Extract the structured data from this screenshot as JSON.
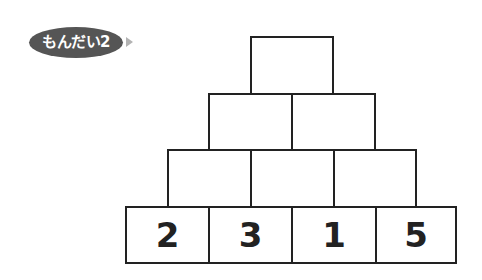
{
  "header": {
    "badge_label": "もんだい2",
    "arrow_icon": "triangle-right-icon"
  },
  "pyramid": {
    "rows": [
      {
        "cells": [
          ""
        ]
      },
      {
        "cells": [
          "",
          ""
        ]
      },
      {
        "cells": [
          "",
          "",
          ""
        ]
      },
      {
        "cells": [
          "2",
          "3",
          "1",
          "5"
        ]
      }
    ]
  },
  "colors": {
    "badge_bg": "#555555",
    "badge_text": "#ffffff",
    "arrow": "#b3b3b3",
    "border": "#222222"
  }
}
